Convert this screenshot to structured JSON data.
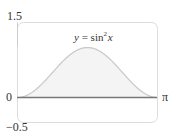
{
  "chart_data": {
    "type": "area",
    "function": "sin^2(x)",
    "xlabel": "",
    "ylabel": "",
    "xlim": [
      0,
      3.14159
    ],
    "ylim": [
      -0.5,
      1.5
    ],
    "x_tick_labels": [
      "π"
    ],
    "y_tick_labels": [
      "1.5",
      "0",
      "−0.5"
    ],
    "x": [
      0,
      0.3927,
      0.7854,
      1.1781,
      1.5708,
      1.9635,
      2.3562,
      2.7489,
      3.1416
    ],
    "values": [
      0,
      0.1464,
      0.5,
      0.8536,
      1.0,
      0.8536,
      0.5,
      0.1464,
      0
    ],
    "grid": false,
    "legend": null,
    "colors": {
      "curve": "#c8c8c8",
      "fill": "#f4f4f4",
      "axis": "#777777",
      "frame": "#dddddd"
    }
  },
  "labels": {
    "y_top": "1.5",
    "y_zero": "0",
    "y_bottom": "−0.5",
    "x_end": "π",
    "title_y": "y",
    "title_eq": " = sin",
    "title_exp": "2",
    "title_x": "x"
  }
}
